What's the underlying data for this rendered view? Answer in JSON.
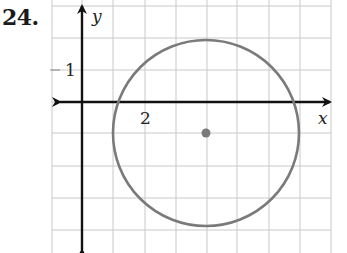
{
  "problem": {
    "number": "24."
  },
  "chart_data": {
    "type": "scatter",
    "title": "",
    "xlabel": "x",
    "ylabel": "y",
    "tick_labels": {
      "x": [
        {
          "value": 2,
          "label": "2"
        }
      ],
      "y": [
        {
          "value": 1,
          "label": "1"
        }
      ]
    },
    "grid": true,
    "xlim": [
      -1,
      8
    ],
    "ylim": [
      -5,
      3
    ],
    "shapes": [
      {
        "kind": "circle",
        "center": [
          4,
          -1
        ],
        "radius": 3,
        "color": "#7a7a7a"
      }
    ],
    "points": [
      {
        "x": 4,
        "y": -1,
        "label": "center",
        "color": "#7a7a7a"
      }
    ]
  },
  "layout": {
    "origin_px": [
      82,
      102
    ],
    "unit_px": 31,
    "grid_x_px": [
      52,
      82,
      113,
      145,
      176,
      207,
      237,
      269,
      300,
      331
    ],
    "grid_y_px": [
      6,
      38,
      70,
      102,
      133,
      166,
      198,
      230
    ]
  },
  "labels": {
    "x_axis": "x",
    "y_axis": "y",
    "x_tick": "2",
    "y_tick": "1"
  }
}
